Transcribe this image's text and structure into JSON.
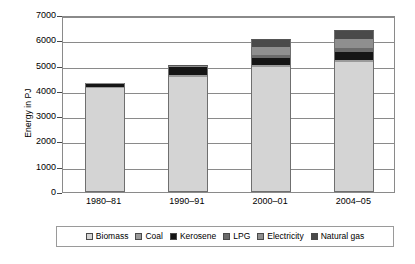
{
  "chart_data": {
    "type": "bar",
    "stacked": true,
    "title": "",
    "xlabel": "",
    "ylabel": "Energy in PJ",
    "ylim": [
      0,
      7000
    ],
    "ytick_step": 1000,
    "yticks": [
      "0",
      "1000",
      "2000",
      "3000",
      "4000",
      "5000",
      "6000",
      "7000"
    ],
    "grid": true,
    "legend_position": "bottom",
    "categories": [
      "1980–81",
      "1990–91",
      "2000–01",
      "2004–05"
    ],
    "series": [
      {
        "name": "Biomass",
        "color": "#d4d4d4",
        "values": [
          4100,
          4550,
          4950,
          5150
        ]
      },
      {
        "name": "Coal",
        "color": "#9a9a9a",
        "values": [
          60,
          60,
          60,
          70
        ]
      },
      {
        "name": "Kerosene",
        "color": "#151515",
        "values": [
          120,
          330,
          310,
          330
        ]
      },
      {
        "name": "LPG",
        "color": "#6b6b6b",
        "values": [
          10,
          20,
          80,
          130
        ]
      },
      {
        "name": "Electricity",
        "color": "#8f8f8f",
        "values": [
          10,
          20,
          330,
          380
        ]
      },
      {
        "name": "Natural gas",
        "color": "#4a4a4a",
        "values": [
          0,
          20,
          320,
          340
        ]
      }
    ],
    "totals": [
      4300,
      5000,
      6050,
      6400
    ]
  },
  "legend": {
    "items": [
      {
        "label": "Biomass"
      },
      {
        "label": "Coal"
      },
      {
        "label": "Kerosene"
      },
      {
        "label": "LPG"
      },
      {
        "label": "Electricity"
      },
      {
        "label": "Natural gas"
      }
    ]
  }
}
